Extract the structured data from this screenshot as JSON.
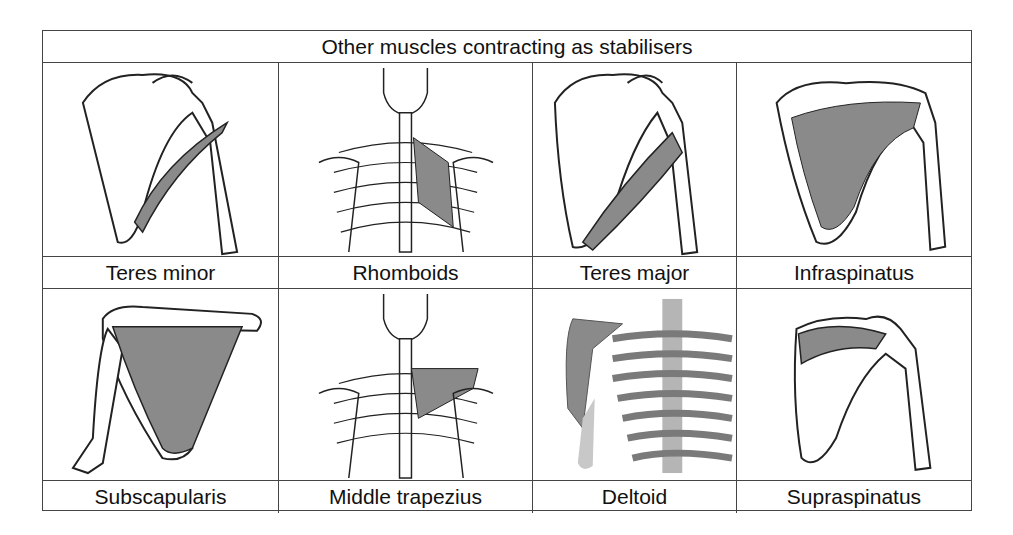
{
  "table": {
    "title": "Other muscles contracting as stabilisers",
    "rows": [
      {
        "muscles": [
          {
            "label": "Teres minor",
            "illustration": "scapula-posterior-teres-minor"
          },
          {
            "label": "Rhomboids",
            "illustration": "upper-back-skeleton-rhomboids"
          },
          {
            "label": "Teres major",
            "illustration": "scapula-posterior-teres-major"
          },
          {
            "label": "Infraspinatus",
            "illustration": "scapula-posterior-infraspinatus"
          }
        ]
      },
      {
        "muscles": [
          {
            "label": "Subscapularis",
            "illustration": "scapula-anterior-subscapularis"
          },
          {
            "label": "Middle trapezius",
            "illustration": "upper-back-skeleton-middle-trapezius"
          },
          {
            "label": "Deltoid",
            "illustration": "anterior-shoulder-ribcage-deltoid"
          },
          {
            "label": "Supraspinatus",
            "illustration": "scapula-posterior-supraspinatus"
          }
        ]
      }
    ]
  },
  "colors": {
    "muscle_fill": "#8a8a8a",
    "outline": "#222222",
    "bone_fill": "#ffffff",
    "border": "#444444"
  }
}
